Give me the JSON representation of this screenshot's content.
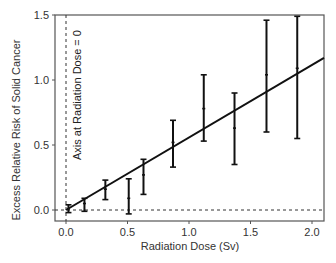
{
  "chart_data": {
    "type": "scatter",
    "title": "",
    "xlabel": "Radiation Dose (Sv)",
    "ylabel": "Excess Relative Risk of Solid Cancer",
    "xlim": [
      -0.1,
      2.1
    ],
    "ylim": [
      -0.08,
      1.5
    ],
    "x_ticks": [
      0.0,
      0.5,
      1.0,
      1.5,
      2.0
    ],
    "x_tick_labels": [
      "0.0",
      "0.5",
      "1.0",
      "1.5",
      "2.0"
    ],
    "y_ticks": [
      0.0,
      0.5,
      1.0,
      1.5
    ],
    "y_tick_labels": [
      "0.0",
      "0.5",
      "1.0",
      "1.5"
    ],
    "grid": false,
    "legend": null,
    "series": [
      {
        "name": "Observed ERR (with error bars)",
        "style": "points-with-errorbars",
        "x": [
          0.02,
          0.15,
          0.32,
          0.51,
          0.63,
          0.87,
          1.12,
          1.37,
          1.63,
          1.88
        ],
        "y": [
          0.01,
          0.05,
          0.16,
          0.09,
          0.27,
          0.52,
          0.78,
          0.63,
          1.04,
          1.09
        ],
        "y_lower": [
          -0.02,
          -0.01,
          0.08,
          -0.03,
          0.12,
          0.33,
          0.53,
          0.35,
          0.6,
          0.55
        ],
        "y_upper": [
          0.04,
          0.09,
          0.23,
          0.24,
          0.39,
          0.69,
          1.04,
          0.9,
          1.46,
          1.49
        ]
      },
      {
        "name": "Linear fit",
        "style": "line",
        "x": [
          0.0,
          2.1
        ],
        "y": [
          0.0,
          1.17
        ]
      }
    ],
    "reference_lines": [
      {
        "orientation": "vertical",
        "value": 0.0,
        "style": "dashed"
      },
      {
        "orientation": "horizontal",
        "value": 0.0,
        "style": "dashed"
      }
    ],
    "annotations": [
      {
        "text": "Axis at Radiation Dose = 0",
        "rotation": -90
      }
    ]
  },
  "labels": {
    "xlabel": "Radiation Dose (Sv)",
    "ylabel": "Excess Relative Risk of Solid Cancer",
    "annotation": "Axis at Radiation Dose = 0"
  }
}
